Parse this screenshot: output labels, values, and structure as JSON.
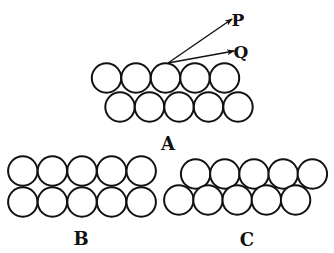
{
  "figure": {
    "panels": [
      {
        "id": "A",
        "label": "A",
        "label_pos": [
          168,
          150
        ],
        "description": "Staggered (close-packed) two-row arrangement of spheres with two rays P and Q leaving the surface",
        "rows": [
          {
            "y": 78,
            "x": [
              106.5,
              136,
              165.5,
              195,
              224.5
            ]
          },
          {
            "y": 107,
            "x": [
              120,
              149.5,
              179,
              208.5,
              238
            ]
          }
        ],
        "radius": 14.7,
        "rays": [
          {
            "label": "P",
            "from": [
              168,
              63
            ],
            "to": [
              232,
              19
            ],
            "label_pos": [
              238,
              26
            ]
          },
          {
            "label": "Q",
            "from": [
              168,
              63
            ],
            "to": [
              234,
              51
            ],
            "label_pos": [
              241,
              58
            ]
          }
        ]
      },
      {
        "id": "B",
        "label": "B",
        "label_pos": [
          81,
          245
        ],
        "description": "Square (aligned) two-row arrangement of spheres",
        "rows": [
          {
            "y": 171,
            "x": [
              22.8,
              52.4,
              82,
              111.6,
              141.2
            ]
          },
          {
            "y": 202,
            "x": [
              22.8,
              52.4,
              82,
              111.6,
              141.2
            ]
          }
        ],
        "radius": 14.7
      },
      {
        "id": "C",
        "label": "C",
        "label_pos": [
          247,
          246
        ],
        "description": "Staggered two-row arrangement of spheres, top row shifted right",
        "rows": [
          {
            "y": 174,
            "x": [
              195.6,
              224.8,
              254,
              283.2,
              312.4
            ]
          },
          {
            "y": 200,
            "x": [
              178.8,
              208,
              237.2,
              266.4,
              295.6
            ]
          }
        ],
        "radius": 14.7
      }
    ],
    "colors": {
      "stroke": "#111111",
      "background": "#ffffff"
    }
  }
}
